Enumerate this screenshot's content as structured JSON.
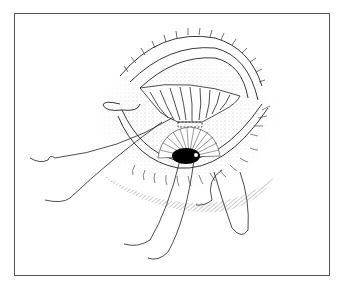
{
  "figure": {
    "type": "medical-illustration",
    "frame_color": "#555555",
    "ink_color": "#222222",
    "pupil_color": "#000000"
  }
}
